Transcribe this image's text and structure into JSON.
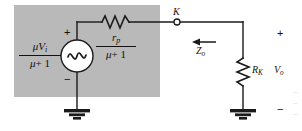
{
  "figure": {
    "type": "electrical-circuit-schematic",
    "shaded_region": {
      "color": "#b9b9b9",
      "meaning": "equivalent source network"
    },
    "wire_color": "#1a1a1a",
    "background": "#ffffff"
  },
  "source": {
    "label_numerator": "μV",
    "label_numerator_sub": "i",
    "label_denominator_mu": "μ",
    "label_denominator_rest": "+ 1",
    "plus_sign": "+",
    "minus_sign": "−",
    "symbol": "ac-sine-source"
  },
  "series_resistor": {
    "numerator": "r",
    "numerator_sub": "p",
    "denominator_mu": "μ",
    "denominator_rest": "+ 1",
    "symbol": "zigzag-resistor-horizontal"
  },
  "node": {
    "label": "K",
    "symbol": "open-terminal-dot"
  },
  "impedance": {
    "label": "Z",
    "label_sub": "o",
    "arrow_direction": "left"
  },
  "load_resistor": {
    "label": "R",
    "label_sub": "K",
    "symbol": "zigzag-resistor-vertical"
  },
  "output": {
    "plus_sign": "+",
    "label": "V",
    "label_sub": "o",
    "minus_sign": "−"
  },
  "grounds": [
    {
      "name": "source-ground",
      "symbol": "earth-ground"
    },
    {
      "name": "load-ground",
      "symbol": "earth-ground"
    }
  ],
  "caption_fragment": {
    "line1": "—",
    "line2": "—",
    "line3": "—"
  }
}
